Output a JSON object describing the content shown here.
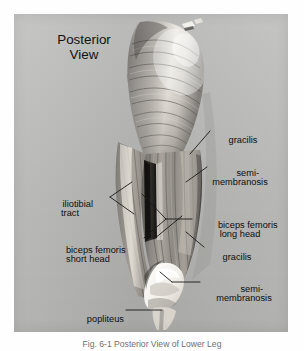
{
  "figure": {
    "title_line1": "Posterior",
    "title_line2": "View",
    "title": "Posterior View",
    "caption": "Fig. 6-1 Posterior View of Lower Leg",
    "panel_color": "#b9b9b7",
    "page_color": "#ffffff",
    "label_color": "#0c0c0c",
    "leader_color": "#1a1a1a",
    "view": "Posterior View",
    "image_kind": "grayscale-anatomical-photograph"
  },
  "labels": [
    {
      "id": "gracilis-upper",
      "text": "gracilis",
      "line1": "gracilis",
      "line2": "",
      "side": "right"
    },
    {
      "id": "semimembranosis-upper",
      "text": "semi-membranosis",
      "line1": "semi-",
      "line2": "membranosis",
      "side": "right"
    },
    {
      "id": "iliotibial-tract",
      "text": "iliotibial tract",
      "line1": "iliotibial",
      "line2": "tract",
      "side": "left"
    },
    {
      "id": "biceps-femoris-long-head",
      "text": "biceps femoris long head",
      "line1": "biceps femoris",
      "line2": "long head",
      "side": "right"
    },
    {
      "id": "gracilis-lower",
      "text": "gracilis",
      "line1": "gracilis",
      "line2": "",
      "side": "right"
    },
    {
      "id": "biceps-femoris-short-head",
      "text": "biceps femoris short head",
      "line1": "biceps femoris",
      "line2": "short head",
      "side": "left"
    },
    {
      "id": "semimembranosis-lower",
      "text": "semi-membranosis",
      "line1": "semi-",
      "line2": "membranosis",
      "side": "right"
    },
    {
      "id": "popliteus",
      "text": "popliteus",
      "line1": "popliteus",
      "line2": "",
      "side": "left"
    }
  ]
}
